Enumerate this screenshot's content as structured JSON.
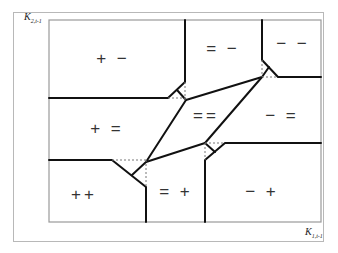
{
  "axes": {
    "y_label": {
      "base": "K",
      "sub": "2,t-1"
    },
    "x_label": {
      "base": "K",
      "sub": "1,t-1"
    }
  },
  "regions": [
    {
      "id": "plus-minus",
      "label": "+ −",
      "x": 113,
      "y": 58
    },
    {
      "id": "equal-minus",
      "label": "= −",
      "x": 223,
      "y": 48
    },
    {
      "id": "minus-minus",
      "label": "− −",
      "x": 293,
      "y": 43
    },
    {
      "id": "plus-equal",
      "label": "+ =",
      "x": 107,
      "y": 128
    },
    {
      "id": "equal-equal",
      "label": "==",
      "x": 205,
      "y": 115
    },
    {
      "id": "minus-equal",
      "label": "− =",
      "x": 282,
      "y": 115
    },
    {
      "id": "plus-plus",
      "label": "++",
      "x": 84,
      "y": 194
    },
    {
      "id": "equal-plus",
      "label": "= +",
      "x": 176,
      "y": 191
    },
    {
      "id": "minus-plus",
      "label": "− +",
      "x": 262,
      "y": 191
    }
  ],
  "colors": {
    "line": "#111111",
    "dotted": "#777777",
    "frame": "#9a9a9a"
  }
}
